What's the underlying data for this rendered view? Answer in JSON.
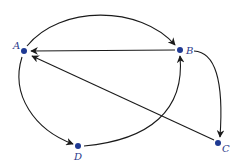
{
  "diagram": {
    "type": "directed-graph",
    "node_color": "#1f3a93",
    "edge_color": "#1a1a1a",
    "nodes": [
      {
        "id": "A",
        "label": "A",
        "x": 24,
        "y": 51
      },
      {
        "id": "B",
        "label": "B",
        "x": 180,
        "y": 50
      },
      {
        "id": "C",
        "label": "C",
        "x": 218,
        "y": 143
      },
      {
        "id": "D",
        "label": "D",
        "x": 78,
        "y": 146
      }
    ],
    "edges": [
      {
        "from": "A",
        "to": "B",
        "shape": "curved-top"
      },
      {
        "from": "B",
        "to": "A",
        "shape": "straight"
      },
      {
        "from": "C",
        "to": "A",
        "shape": "straight"
      },
      {
        "from": "A",
        "to": "D",
        "shape": "curved-left"
      },
      {
        "from": "D",
        "to": "B",
        "shape": "curved-bottom"
      },
      {
        "from": "B",
        "to": "C",
        "shape": "curved-right"
      }
    ]
  }
}
